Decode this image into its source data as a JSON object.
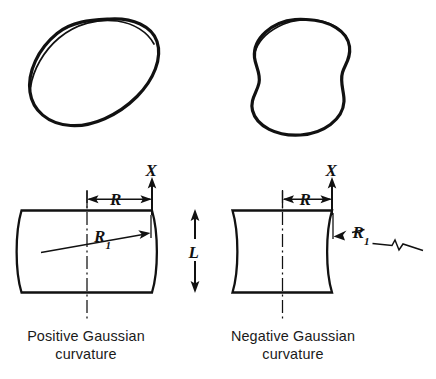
{
  "figure": {
    "ink_color": "#111111",
    "background_color": "#ffffff"
  },
  "panels": {
    "left": {
      "id": "positive-gaussian",
      "caption_line1": "Positive Gaussian",
      "caption_line2": "curvature",
      "solid_shape": "barrel",
      "section_shape": "barrel-convex-sides",
      "labels": {
        "axis": "X",
        "radius_horizontal": "R",
        "radius_meridional_base": "R",
        "radius_meridional_sub": "1"
      }
    },
    "right": {
      "id": "negative-gaussian",
      "caption_line1": "Negative Gaussian",
      "caption_line2": "curvature",
      "solid_shape": "hyperboloid-waisted",
      "section_shape": "hourglass-concave-sides",
      "labels": {
        "axis": "X",
        "radius_horizontal": "R",
        "radius_meridional_base": "R",
        "radius_meridional_sub": "1"
      }
    }
  },
  "center": {
    "length_label": "L"
  }
}
